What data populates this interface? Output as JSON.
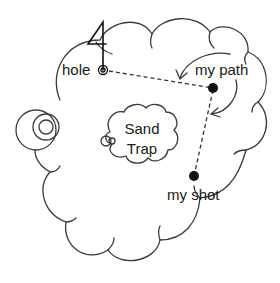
{
  "diagram": {
    "type": "golf-hole-sketch",
    "colors": {
      "line": "#3a3a3a",
      "ball": "#111111",
      "background": "#ffffff"
    },
    "flag": {
      "number": "4"
    },
    "labels": {
      "hole": "hole",
      "my_path": "my path",
      "my_shot": "my shot",
      "sand_line1": "Sand",
      "sand_line2": "Trap"
    },
    "elements": [
      {
        "name": "fairway-green",
        "shape": "cloud"
      },
      {
        "name": "sand-trap",
        "shape": "cloud"
      },
      {
        "name": "tee",
        "shape": "concentric-circles"
      },
      {
        "name": "hole",
        "shape": "concentric-circles"
      },
      {
        "name": "ball-position",
        "shape": "filled-circle"
      },
      {
        "name": "my-shot",
        "shape": "filled-circle"
      }
    ]
  }
}
